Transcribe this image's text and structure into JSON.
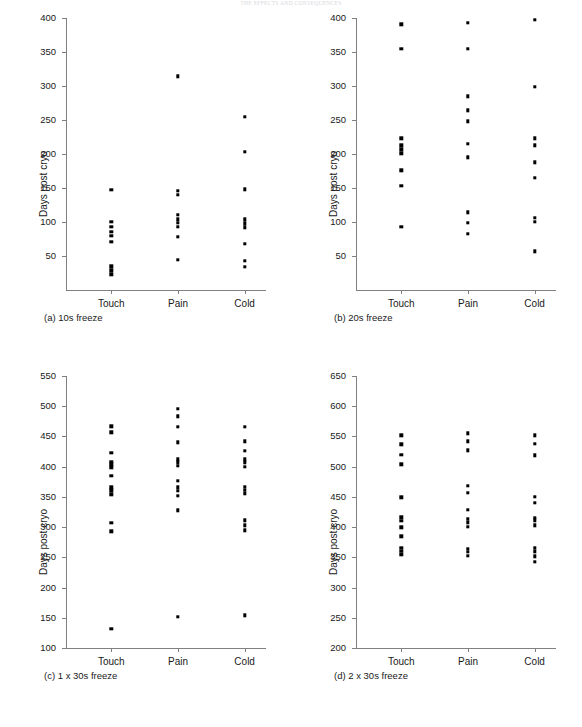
{
  "figure": {
    "running_head": "THE EFFECTS AND CONSEQUENCES",
    "y_axis_label": "Days post cryo",
    "groups": [
      "Touch",
      "Pain",
      "Cold"
    ]
  },
  "chart_data": [
    {
      "type": "scatter",
      "panel_id": "a",
      "title": "(a) 10s freeze",
      "xlabel": "",
      "ylabel": "Days post cryo",
      "categories": [
        "Touch",
        "Pain",
        "Cold"
      ],
      "ylim": [
        0,
        400
      ],
      "yticks": [
        50,
        100,
        150,
        200,
        250,
        300,
        350,
        400
      ],
      "grid": false,
      "legend": "none",
      "series": [
        {
          "name": "Touch",
          "values": [
            147,
            100,
            93,
            86,
            80,
            71,
            35,
            29,
            23
          ]
        },
        {
          "name": "Pain",
          "values": [
            314,
            146,
            140,
            111,
            104,
            99,
            93,
            78,
            44
          ]
        },
        {
          "name": "Cold",
          "values": [
            255,
            203,
            148,
            104,
            98,
            92,
            68,
            43,
            34
          ]
        }
      ]
    },
    {
      "type": "scatter",
      "panel_id": "b",
      "title": "(b) 20s freeze",
      "xlabel": "",
      "ylabel": "Days post cryo",
      "categories": [
        "Touch",
        "Pain",
        "Cold"
      ],
      "ylim": [
        0,
        400
      ],
      "yticks": [
        50,
        100,
        150,
        200,
        250,
        300,
        350,
        400
      ],
      "grid": false,
      "legend": "none",
      "series": [
        {
          "name": "Touch",
          "values": [
            391,
            355,
            223,
            213,
            207,
            201,
            176,
            153,
            93
          ]
        },
        {
          "name": "Pain",
          "values": [
            393,
            355,
            285,
            264,
            248,
            215,
            195,
            114,
            99,
            83
          ]
        },
        {
          "name": "Cold",
          "values": [
            397,
            299,
            223,
            213,
            188,
            165,
            106,
            100,
            57
          ]
        }
      ]
    },
    {
      "type": "scatter",
      "panel_id": "c",
      "title": "(c) 1 x 30s freeze",
      "xlabel": "",
      "ylabel": "Days post cryo",
      "categories": [
        "Touch",
        "Pain",
        "Cold"
      ],
      "ylim": [
        100,
        550
      ],
      "yticks": [
        100,
        150,
        200,
        250,
        300,
        350,
        400,
        450,
        500,
        550
      ],
      "grid": false,
      "legend": "none",
      "series": [
        {
          "name": "Touch",
          "values": [
            467,
            457,
            423,
            408,
            404,
            399,
            385,
            366,
            361,
            354,
            307,
            293,
            132
          ]
        },
        {
          "name": "Pain",
          "values": [
            496,
            483,
            466,
            440,
            412,
            407,
            401,
            377,
            366,
            360,
            352,
            328,
            152
          ]
        },
        {
          "name": "Cold",
          "values": [
            466,
            442,
            426,
            412,
            407,
            400,
            367,
            362,
            356,
            311,
            303,
            295,
            154
          ]
        }
      ]
    },
    {
      "type": "scatter",
      "panel_id": "d",
      "title": "(d) 2 x 30s freeze",
      "xlabel": "",
      "ylabel": "Days post cryo",
      "categories": [
        "Touch",
        "Pain",
        "Cold"
      ],
      "ylim": [
        200,
        650
      ],
      "yticks": [
        200,
        250,
        300,
        350,
        400,
        450,
        500,
        550,
        600,
        650
      ],
      "grid": false,
      "legend": "none",
      "series": [
        {
          "name": "Touch",
          "values": [
            552,
            537,
            520,
            504,
            449,
            416,
            410,
            400,
            385,
            366,
            361,
            355
          ]
        },
        {
          "name": "Pain",
          "values": [
            555,
            542,
            527,
            468,
            457,
            429,
            414,
            408,
            401,
            364,
            359,
            353
          ]
        },
        {
          "name": "Cold",
          "values": [
            552,
            538,
            519,
            450,
            440,
            415,
            411,
            403,
            366,
            360,
            352,
            343
          ]
        }
      ]
    }
  ]
}
